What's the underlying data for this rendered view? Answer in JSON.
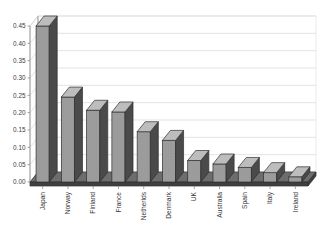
{
  "chart_data": {
    "type": "bar",
    "title": "",
    "subtitle": "",
    "xlabel": "",
    "ylabel": "",
    "categories": [
      "Japan",
      "Norway",
      "Finland",
      "France",
      "Netherlds",
      "Denmark",
      "UK",
      "Australia",
      "Spain",
      "Italy",
      "Ireland"
    ],
    "values": [
      0.45,
      0.245,
      0.207,
      0.202,
      0.145,
      0.12,
      0.062,
      0.052,
      0.042,
      0.027,
      0.015
    ],
    "series": [
      {
        "name": "",
        "values": [
          0.45,
          0.245,
          0.207,
          0.202,
          0.145,
          0.12,
          0.062,
          0.052,
          0.042,
          0.027,
          0.015
        ]
      }
    ],
    "ylim": [
      0.0,
      0.45
    ],
    "ytick_values": [
      0.0,
      0.05,
      0.1,
      0.15,
      0.2,
      0.25,
      0.3,
      0.35,
      0.4,
      0.45
    ],
    "ytick_labels": [
      "0.00",
      "0.05",
      "0.10",
      "0.15",
      "0.20",
      "0.25",
      "0.30",
      "0.35",
      "0.40",
      "0.45"
    ],
    "grid": true,
    "grid_axis": "y",
    "legend": false,
    "legend_position": "none",
    "style": "3d-column",
    "annotations": []
  },
  "axis": {
    "y_ticks": [
      {
        "label": "0.45"
      },
      {
        "label": "0.40"
      },
      {
        "label": "0.35"
      },
      {
        "label": "0.30"
      },
      {
        "label": "0.25"
      },
      {
        "label": "0.20"
      },
      {
        "label": "0.15"
      },
      {
        "label": "0.10"
      },
      {
        "label": "0.05"
      },
      {
        "label": "0.00"
      }
    ]
  },
  "colors": {
    "bar_front": "#9c9c9c",
    "bar_side": "#4a4a4a",
    "bar_top": "#bdbdbd",
    "gridline": "#d8d8d8",
    "axis": "#8d8d8d",
    "floor_top": "#6d6d6d",
    "floor_front": "#3f3f3f",
    "text": "#3b3b3b",
    "background": "#ffffff"
  }
}
